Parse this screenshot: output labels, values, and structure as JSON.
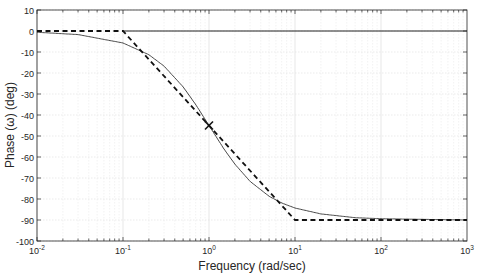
{
  "chart_data": {
    "type": "line",
    "title": "",
    "xlabel": "Frequency (rad/sec)",
    "ylabel": "Phase (ω) (deg)",
    "xscale": "log",
    "xlim": [
      0.01,
      1000
    ],
    "ylim": [
      -100,
      10
    ],
    "grid": true,
    "legend": null,
    "x_ticks": [
      {
        "base": "10",
        "exp": "-2",
        "value": 0.01
      },
      {
        "base": "10",
        "exp": "-1",
        "value": 0.1
      },
      {
        "base": "10",
        "exp": "0",
        "value": 1
      },
      {
        "base": "10",
        "exp": "1",
        "value": 10
      },
      {
        "base": "10",
        "exp": "2",
        "value": 100
      },
      {
        "base": "10",
        "exp": "3",
        "value": 1000
      }
    ],
    "y_ticks": [
      10,
      0,
      -10,
      -20,
      -30,
      -40,
      -50,
      -60,
      -70,
      -80,
      -90,
      -100
    ],
    "series": [
      {
        "name": "Exact phase",
        "style": "solid thin",
        "x": [
          0.01,
          0.03,
          0.1,
          0.2,
          0.3,
          0.5,
          0.7,
          1,
          1.5,
          2,
          3,
          5,
          7,
          10,
          20,
          50,
          100,
          1000
        ],
        "values": [
          -0.6,
          -1.7,
          -5.7,
          -11.3,
          -16.7,
          -26.6,
          -35.0,
          -45.0,
          -56.3,
          -63.4,
          -71.6,
          -78.7,
          -81.9,
          -84.3,
          -87.1,
          -88.9,
          -89.4,
          -90.0
        ]
      },
      {
        "name": "Asymptotic approximation",
        "style": "dashed thick",
        "x": [
          0.01,
          0.1,
          10,
          1000
        ],
        "values": [
          0,
          0,
          -90,
          -90
        ]
      },
      {
        "name": "Zero reference",
        "style": "solid",
        "x": [
          0.1,
          1000
        ],
        "values": [
          0,
          0
        ]
      }
    ],
    "annotations": [
      {
        "type": "marker",
        "symbol": "x",
        "x": 1,
        "y": -45
      }
    ]
  }
}
